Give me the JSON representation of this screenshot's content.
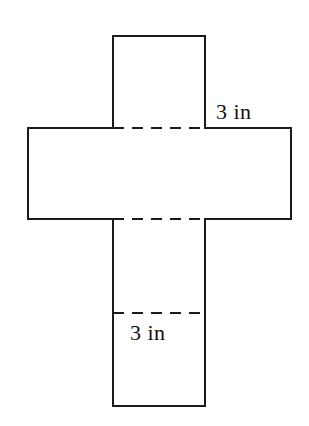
{
  "figure": {
    "kind": "cube-net-diagram",
    "background_color": "#ffffff",
    "line_color": "#1a1a1a",
    "line_width": 2,
    "labels": [
      {
        "id": "top-right",
        "text": "3 in",
        "x": 216,
        "y": 99
      },
      {
        "id": "bottom",
        "text": "3 in",
        "x": 130,
        "y": 320
      }
    ],
    "geometry": {
      "vertical_strip": {
        "x1": 113,
        "y1": 36,
        "x2": 205,
        "y2": 406
      },
      "horizontal_strip": {
        "x1": 28,
        "y1": 128,
        "x2": 291,
        "y2": 219
      },
      "fold_lines_y": [
        128,
        219,
        313
      ],
      "fold_line_x_start": 113,
      "fold_line_x_end": 205,
      "square_side_px": 92
    }
  }
}
